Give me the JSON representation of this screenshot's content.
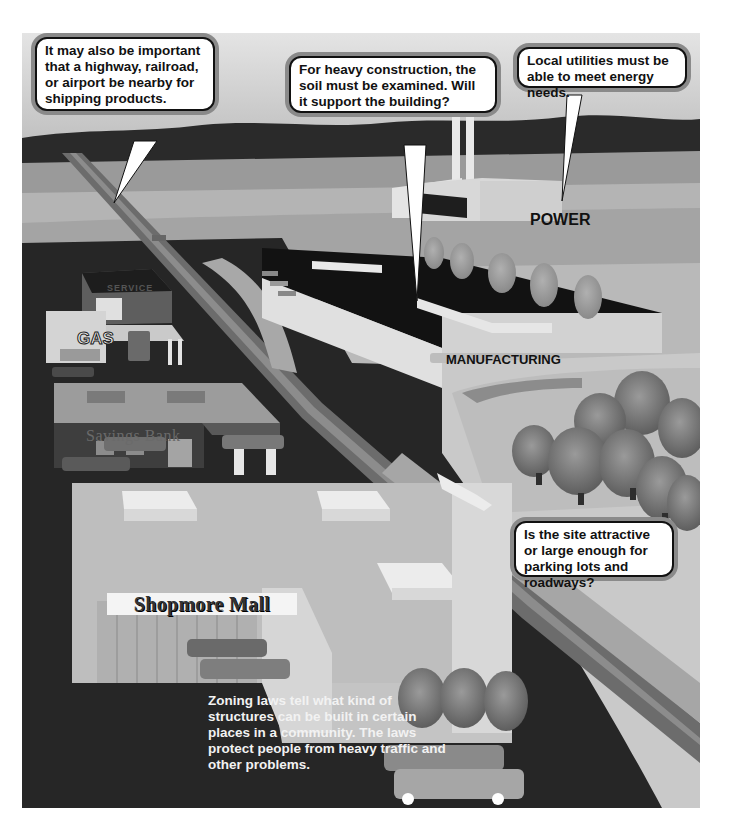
{
  "illustration": {
    "callouts": {
      "transportation": "It may also be important that a highway, railroad, or airport be nearby for shipping products.",
      "soil": "For heavy construction, the soil must be examined. Will it support the building?",
      "utilities": "Local utilities must be able to meet energy needs.",
      "site": "Is the site attractive or large enough for parking lots and roadways?"
    },
    "building_labels": {
      "power": "POWER",
      "manufacturing": "MANUFACTURING",
      "gas": "GAS",
      "service": "SERVICE",
      "bank": "Savings Bank",
      "mall": "Shopmore Mall"
    },
    "caption": {
      "bold": "Zoning laws",
      "rest": " tell what kind of structures can be built in certain places in a community.  The laws protect people from heavy traffic and other problems."
    }
  }
}
